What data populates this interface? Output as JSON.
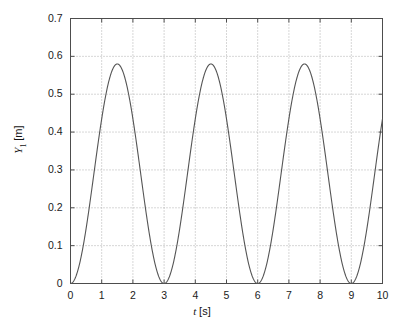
{
  "chart_data": {
    "type": "line",
    "title": "",
    "subtitle": "",
    "xlabel": "t [s]",
    "ylabel": "Y1 [m]",
    "xlabel_parts": {
      "variable": "t",
      "unit": "[s]"
    },
    "ylabel_parts": {
      "variable": "Y",
      "subscript": "1",
      "unit": "[m]"
    },
    "xlim": [
      0,
      10
    ],
    "ylim": [
      0,
      0.7
    ],
    "xticks": [
      0,
      1,
      2,
      3,
      4,
      5,
      6,
      7,
      8,
      9,
      10
    ],
    "xtick_labels": [
      "0",
      "1",
      "2",
      "3",
      "4",
      "5",
      "6",
      "7",
      "8",
      "9",
      "10"
    ],
    "yticks": [
      0,
      0.1,
      0.2,
      0.3,
      0.4,
      0.5,
      0.6,
      0.7
    ],
    "ytick_labels": [
      "0",
      "0.1",
      "0.2",
      "0.3",
      "0.4",
      "0.5",
      "0.6",
      "0.7"
    ],
    "grid": true,
    "grid_style": "dotted",
    "grid_color": "#9a9a9a",
    "legend": null,
    "legend_position": "none",
    "line_color": "#555555",
    "line_width": 1.0,
    "frame_color": "#4d4d4d",
    "background": "#ffffff",
    "annotations": [],
    "period_s": 3,
    "peak_value": 0.58,
    "minimum_value": 0,
    "end_value": 0.48,
    "peak_times": [
      1.5,
      4.5,
      7.5
    ],
    "zero_times": [
      0,
      3,
      6,
      9
    ],
    "series": [
      {
        "name": "Y1",
        "x": [
          0,
          0.25,
          0.5,
          0.75,
          1,
          1.25,
          1.5,
          1.75,
          2,
          2.25,
          2.5,
          2.75,
          3,
          3.25,
          3.5,
          3.75,
          4,
          4.25,
          4.5,
          4.75,
          5,
          5.25,
          5.5,
          5.75,
          6,
          6.25,
          6.5,
          6.75,
          7,
          7.25,
          7.5,
          7.75,
          8,
          8.25,
          8.5,
          8.75,
          9,
          9.25,
          9.5,
          9.75,
          10
        ],
        "values": [
          0,
          0.0444,
          0.1657,
          0.327,
          0.4807,
          0.5688,
          0.58,
          0.5688,
          0.4807,
          0.327,
          0.1657,
          0.0444,
          0,
          0.0444,
          0.1657,
          0.327,
          0.4807,
          0.5688,
          0.58,
          0.5688,
          0.4807,
          0.327,
          0.1657,
          0.0444,
          0,
          0.0444,
          0.1657,
          0.327,
          0.4807,
          0.5688,
          0.58,
          0.5688,
          0.4807,
          0.327,
          0.1657,
          0.0444,
          0,
          0.0444,
          0.1657,
          0.327,
          0.48
        ]
      }
    ]
  }
}
